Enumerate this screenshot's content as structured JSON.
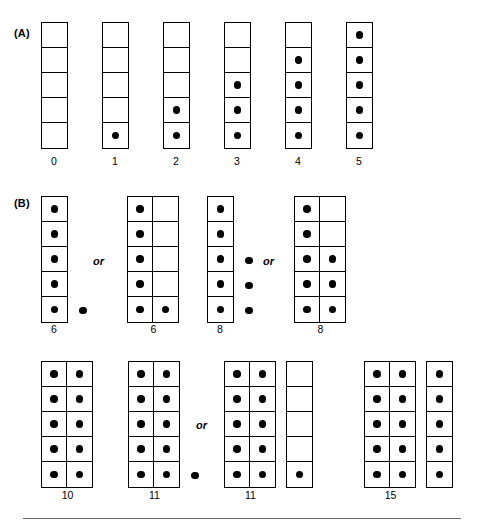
{
  "figure": {
    "background_color": "#ffffff",
    "ink_color": "#000000",
    "rule_color": "#6b6b6b"
  },
  "panels": [
    {
      "id": "panel-a",
      "label": "(A)",
      "label_x": 14,
      "label_y": 28,
      "groups": [
        {
          "id": "a-0",
          "x": 41,
          "y": 22,
          "label": "0",
          "label_x": 41,
          "label_y": 156,
          "label_width": 26,
          "grids": [
            {
              "cols": 1,
              "rows": 5,
              "filled": [
                [
                  false
                ],
                [
                  false
                ],
                [
                  false
                ],
                [
                  false
                ],
                [
                  false
                ]
              ]
            }
          ],
          "loose": [],
          "total": 0
        },
        {
          "id": "a-1",
          "x": 102,
          "y": 22,
          "label": "1",
          "label_x": 102,
          "label_y": 156,
          "label_width": 26,
          "grids": [
            {
              "cols": 1,
              "rows": 5,
              "filled": [
                [
                  false
                ],
                [
                  false
                ],
                [
                  false
                ],
                [
                  false
                ],
                [
                  true
                ]
              ]
            }
          ],
          "loose": [],
          "total": 1
        },
        {
          "id": "a-2",
          "x": 163,
          "y": 22,
          "label": "2",
          "label_x": 163,
          "label_y": 156,
          "label_width": 26,
          "grids": [
            {
              "cols": 1,
              "rows": 5,
              "filled": [
                [
                  false
                ],
                [
                  false
                ],
                [
                  false
                ],
                [
                  true
                ],
                [
                  true
                ]
              ]
            }
          ],
          "loose": [],
          "total": 2
        },
        {
          "id": "a-3",
          "x": 224,
          "y": 22,
          "label": "3",
          "label_x": 224,
          "label_y": 156,
          "label_width": 26,
          "grids": [
            {
              "cols": 1,
              "rows": 5,
              "filled": [
                [
                  false
                ],
                [
                  false
                ],
                [
                  true
                ],
                [
                  true
                ],
                [
                  true
                ]
              ]
            }
          ],
          "loose": [],
          "total": 3
        },
        {
          "id": "a-4",
          "x": 285,
          "y": 22,
          "label": "4",
          "label_x": 285,
          "label_y": 156,
          "label_width": 26,
          "grids": [
            {
              "cols": 1,
              "rows": 5,
              "filled": [
                [
                  false
                ],
                [
                  true
                ],
                [
                  true
                ],
                [
                  true
                ],
                [
                  true
                ]
              ]
            }
          ],
          "loose": [],
          "total": 4
        },
        {
          "id": "a-5",
          "x": 346,
          "y": 22,
          "label": "5",
          "label_x": 346,
          "label_y": 156,
          "label_width": 26,
          "grids": [
            {
              "cols": 1,
              "rows": 5,
              "filled": [
                [
                  true
                ],
                [
                  true
                ],
                [
                  true
                ],
                [
                  true
                ],
                [
                  true
                ]
              ]
            }
          ],
          "loose": [],
          "total": 5
        }
      ],
      "connectors": []
    },
    {
      "id": "panel-b",
      "label": "(B)",
      "label_x": 14,
      "label_y": 198,
      "groups": [
        {
          "id": "b-6a",
          "x": 41,
          "y": 196,
          "label": "6",
          "label_x": 41,
          "label_y": 324,
          "label_width": 26,
          "grids": [
            {
              "cols": 1,
              "rows": 5,
              "filled": [
                [
                  true
                ],
                [
                  true
                ],
                [
                  true
                ],
                [
                  true
                ],
                [
                  true
                ]
              ]
            }
          ],
          "loose": [
            false,
            false,
            false,
            false,
            true
          ],
          "total": 6
        },
        {
          "id": "b-6b",
          "x": 127,
          "y": 196,
          "label": "6",
          "label_x": 127,
          "label_y": 324,
          "label_width": 53,
          "grids": [
            {
              "cols": 2,
              "rows": 5,
              "filled": [
                [
                  true,
                  false
                ],
                [
                  true,
                  false
                ],
                [
                  true,
                  false
                ],
                [
                  true,
                  false
                ],
                [
                  true,
                  true
                ]
              ]
            }
          ],
          "loose": [],
          "total": 6
        },
        {
          "id": "b-8a",
          "x": 207,
          "y": 196,
          "label": "8",
          "label_x": 207,
          "label_y": 324,
          "label_width": 26,
          "grids": [
            {
              "cols": 1,
              "rows": 5,
              "filled": [
                [
                  true
                ],
                [
                  true
                ],
                [
                  true
                ],
                [
                  true
                ],
                [
                  true
                ]
              ]
            }
          ],
          "loose": [
            false,
            false,
            true,
            true,
            true
          ],
          "total": 8
        },
        {
          "id": "b-8b",
          "x": 294,
          "y": 196,
          "label": "8",
          "label_x": 294,
          "label_y": 324,
          "label_width": 53,
          "grids": [
            {
              "cols": 2,
              "rows": 5,
              "filled": [
                [
                  true,
                  false
                ],
                [
                  true,
                  false
                ],
                [
                  true,
                  true
                ],
                [
                  true,
                  true
                ],
                [
                  true,
                  true
                ]
              ]
            }
          ],
          "loose": [],
          "total": 8
        },
        {
          "id": "b-10",
          "x": 41,
          "y": 361,
          "label": "10",
          "label_x": 41,
          "label_y": 490,
          "label_width": 53,
          "grids": [
            {
              "cols": 2,
              "rows": 5,
              "filled": [
                [
                  true,
                  true
                ],
                [
                  true,
                  true
                ],
                [
                  true,
                  true
                ],
                [
                  true,
                  true
                ],
                [
                  true,
                  true
                ]
              ]
            }
          ],
          "loose": [],
          "total": 10
        },
        {
          "id": "b-11a",
          "x": 128,
          "y": 361,
          "label": "11",
          "label_x": 128,
          "label_y": 490,
          "label_width": 53,
          "grids": [
            {
              "cols": 2,
              "rows": 5,
              "filled": [
                [
                  true,
                  true
                ],
                [
                  true,
                  true
                ],
                [
                  true,
                  true
                ],
                [
                  true,
                  true
                ],
                [
                  true,
                  true
                ]
              ]
            }
          ],
          "loose": [
            false,
            false,
            false,
            false,
            true
          ],
          "total": 11
        },
        {
          "id": "b-11b",
          "x": 224,
          "y": 361,
          "label": "11",
          "label_x": 224,
          "label_y": 490,
          "label_width": 53,
          "grids": [
            {
              "cols": 2,
              "rows": 5,
              "filled": [
                [
                  true,
                  true
                ],
                [
                  true,
                  true
                ],
                [
                  true,
                  true
                ],
                [
                  true,
                  true
                ],
                [
                  true,
                  true
                ]
              ]
            },
            {
              "cols": 1,
              "rows": 5,
              "filled": [
                [
                  false
                ],
                [
                  false
                ],
                [
                  false
                ],
                [
                  false
                ],
                [
                  true
                ]
              ]
            }
          ],
          "loose": [],
          "total": 11
        },
        {
          "id": "b-15",
          "x": 364,
          "y": 361,
          "label": "15",
          "label_x": 364,
          "label_y": 490,
          "label_width": 53,
          "grids": [
            {
              "cols": 2,
              "rows": 5,
              "filled": [
                [
                  true,
                  true
                ],
                [
                  true,
                  true
                ],
                [
                  true,
                  true
                ],
                [
                  true,
                  true
                ],
                [
                  true,
                  true
                ]
              ]
            },
            {
              "cols": 1,
              "rows": 5,
              "filled": [
                [
                  true
                ],
                [
                  true
                ],
                [
                  true
                ],
                [
                  true
                ],
                [
                  true
                ]
              ]
            }
          ],
          "loose": [],
          "total": 15
        }
      ],
      "connectors": [
        {
          "id": "or-1",
          "text": "or",
          "x": 93,
          "y": 256
        },
        {
          "id": "or-2",
          "text": "or",
          "x": 263,
          "y": 256
        },
        {
          "id": "or-3",
          "text": "or",
          "x": 196,
          "y": 420
        }
      ]
    }
  ]
}
